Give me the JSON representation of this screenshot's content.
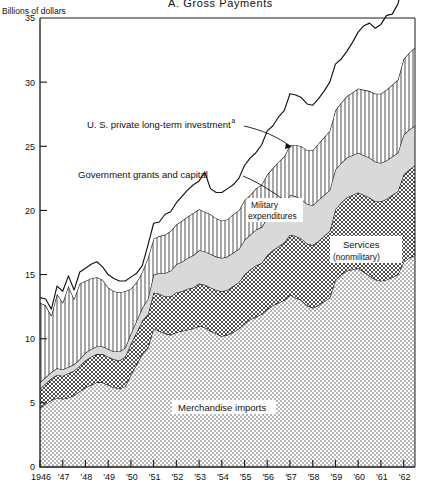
{
  "figure": {
    "panel_title": "A.   Gross  Payments",
    "y_unit_label": "Billions of dollars"
  },
  "chart_data": {
    "type": "area",
    "title": "A.   Gross  Payments",
    "subtitle": "",
    "xlabel": "",
    "ylabel": "Billions of dollars",
    "stacked": true,
    "grid": false,
    "legend_position": "inline-annotations",
    "xlim": [
      1946,
      1962.75
    ],
    "ylim": [
      0,
      35
    ],
    "yticks": [
      0,
      5,
      10,
      15,
      20,
      25,
      30,
      35
    ],
    "ytick_labels": [
      "0",
      "5",
      "10",
      "15",
      "20",
      "25",
      "30",
      "35"
    ],
    "xticks": [
      1946,
      1947,
      1948,
      1949,
      1950,
      1951,
      1952,
      1953,
      1954,
      1955,
      1956,
      1957,
      1958,
      1959,
      1960,
      1961,
      1962
    ],
    "xtick_labels": [
      "1946",
      "'47",
      "'48",
      "'49",
      "'50",
      "'51",
      "'52",
      "'53",
      "'54",
      "'55",
      "'56",
      "'57",
      "'58",
      "'59",
      "'60",
      "'61",
      "'62"
    ],
    "x": [
      1946.0,
      1946.25,
      1946.5,
      1946.75,
      1947.0,
      1947.25,
      1947.5,
      1947.75,
      1948.0,
      1948.25,
      1948.5,
      1948.75,
      1949.0,
      1949.25,
      1949.5,
      1949.75,
      1950.0,
      1950.25,
      1950.5,
      1950.75,
      1951.0,
      1951.25,
      1951.5,
      1951.75,
      1952.0,
      1952.25,
      1952.5,
      1952.75,
      1953.0,
      1953.25,
      1953.5,
      1953.75,
      1954.0,
      1954.25,
      1954.5,
      1954.75,
      1955.0,
      1955.25,
      1955.5,
      1955.75,
      1956.0,
      1956.25,
      1956.5,
      1956.75,
      1957.0,
      1957.25,
      1957.5,
      1957.75,
      1958.0,
      1958.25,
      1958.5,
      1958.75,
      1959.0,
      1959.25,
      1959.5,
      1959.75,
      1960.0,
      1960.25,
      1960.5,
      1960.75,
      1961.0,
      1961.25,
      1961.5,
      1961.75,
      1962.0,
      1962.25,
      1962.5
    ],
    "series": [
      {
        "name": "Merchandise imports",
        "label_text": "Merchandise imports",
        "fill_pattern": "fine-dot",
        "values": [
          4.6,
          4.9,
          5.2,
          5.4,
          5.3,
          5.4,
          5.6,
          5.9,
          6.2,
          6.4,
          6.6,
          6.6,
          6.4,
          6.2,
          6.1,
          6.3,
          7.2,
          8.0,
          8.8,
          9.3,
          10.8,
          10.6,
          10.4,
          10.3,
          10.5,
          10.6,
          10.7,
          10.8,
          11.0,
          10.9,
          10.6,
          10.4,
          10.2,
          10.3,
          10.5,
          10.8,
          11.2,
          11.5,
          11.7,
          11.9,
          12.3,
          12.6,
          12.8,
          13.0,
          13.4,
          13.2,
          13.0,
          12.6,
          12.4,
          12.6,
          12.9,
          13.2,
          14.6,
          15.0,
          15.3,
          15.4,
          15.5,
          15.2,
          14.9,
          14.6,
          14.5,
          14.6,
          14.8,
          15.0,
          16.0,
          16.3,
          16.5
        ]
      },
      {
        "name": "Services (nonmilitary)",
        "label_text": "Services\n(nonmilitary)",
        "fill_pattern": "cross-hatch",
        "values": [
          1.5,
          1.6,
          1.7,
          1.8,
          1.8,
          1.9,
          1.9,
          2.0,
          2.1,
          2.2,
          2.2,
          2.2,
          2.2,
          2.2,
          2.2,
          2.3,
          2.4,
          2.5,
          2.6,
          2.6,
          2.8,
          2.9,
          2.9,
          3.0,
          3.1,
          3.1,
          3.2,
          3.2,
          3.3,
          3.3,
          3.4,
          3.4,
          3.5,
          3.5,
          3.6,
          3.6,
          3.8,
          3.9,
          4.0,
          4.0,
          4.2,
          4.3,
          4.4,
          4.5,
          4.7,
          4.8,
          4.8,
          4.8,
          4.9,
          5.0,
          5.1,
          5.2,
          5.5,
          5.6,
          5.7,
          5.8,
          5.9,
          6.0,
          6.1,
          6.1,
          6.2,
          6.3,
          6.4,
          6.5,
          6.8,
          6.9,
          7.0
        ]
      },
      {
        "name": "Military expenditures",
        "label_text": "Military\nexpenditures",
        "fill_pattern": "light-gray",
        "values": [
          0.5,
          0.5,
          0.5,
          0.5,
          0.5,
          0.5,
          0.5,
          0.5,
          0.6,
          0.6,
          0.6,
          0.6,
          0.6,
          0.6,
          0.7,
          0.7,
          0.8,
          0.9,
          1.0,
          1.2,
          1.4,
          1.6,
          1.8,
          2.0,
          2.2,
          2.3,
          2.4,
          2.5,
          2.6,
          2.6,
          2.6,
          2.6,
          2.6,
          2.6,
          2.6,
          2.6,
          2.7,
          2.7,
          2.8,
          2.8,
          2.9,
          2.9,
          3.0,
          3.0,
          3.1,
          3.1,
          3.1,
          3.1,
          3.1,
          3.2,
          3.2,
          3.2,
          3.1,
          3.1,
          3.1,
          3.1,
          3.1,
          3.1,
          3.1,
          3.1,
          3.0,
          3.0,
          3.0,
          3.0,
          3.1,
          3.1,
          3.1
        ]
      },
      {
        "name": "Government grants and capital",
        "label_text": "Government grants and capital",
        "fill_pattern": "vertical-line",
        "values": [
          6.2,
          5.6,
          4.4,
          5.8,
          5.2,
          6.3,
          5.1,
          5.9,
          5.6,
          5.5,
          5.4,
          5.2,
          4.8,
          4.7,
          4.6,
          4.4,
          3.5,
          3.0,
          2.8,
          3.2,
          2.8,
          2.9,
          3.0,
          3.1,
          3.1,
          3.2,
          3.2,
          3.3,
          3.2,
          3.1,
          3.1,
          3.0,
          2.9,
          2.9,
          3.0,
          3.0,
          3.1,
          3.1,
          3.2,
          3.3,
          3.4,
          3.5,
          3.6,
          3.7,
          3.9,
          4.0,
          4.1,
          4.2,
          4.3,
          4.4,
          4.5,
          4.6,
          4.6,
          4.7,
          4.8,
          4.9,
          5.0,
          5.1,
          5.2,
          5.3,
          5.4,
          5.5,
          5.6,
          5.7,
          5.9,
          6.0,
          6.1
        ]
      },
      {
        "name": "U.S. private long-term investment",
        "label_text": "U. S. private long-term investment",
        "label_superscript": "a",
        "fill_pattern": "white",
        "values": [
          0.4,
          0.5,
          0.5,
          0.6,
          0.9,
          0.8,
          0.7,
          0.9,
          1.0,
          1.1,
          1.2,
          1.0,
          1.0,
          1.0,
          0.9,
          0.8,
          0.9,
          0.7,
          0.5,
          1.0,
          1.2,
          1.1,
          1.6,
          1.5,
          1.7,
          1.9,
          2.1,
          2.2,
          2.2,
          3.1,
          2.0,
          2.0,
          2.2,
          2.4,
          2.3,
          2.5,
          2.7,
          2.9,
          2.8,
          3.1,
          3.4,
          3.3,
          3.5,
          3.6,
          4.0,
          3.9,
          3.8,
          3.6,
          3.5,
          3.5,
          3.6,
          3.8,
          3.6,
          3.4,
          3.5,
          3.9,
          4.4,
          5.0,
          5.3,
          5.1,
          5.4,
          5.8,
          5.5,
          5.9,
          6.0,
          6.4,
          6.2
        ]
      }
    ],
    "annotations": [
      {
        "text": "U. S. private long-term investment",
        "superscript": "a"
      },
      {
        "text": "Government grants and capital"
      },
      {
        "text": "Military expenditures"
      },
      {
        "text": "Services (nonmilitary)"
      },
      {
        "text": "Merchandise imports"
      }
    ]
  },
  "labels": {
    "private_investment": "U. S. private long-term investment",
    "private_investment_sup": "a",
    "gov_grants": "Government grants and capital",
    "military_1": "Military",
    "military_2": "expenditures",
    "services_1": "Services",
    "services_2": "(nonmilitary)",
    "merchandise": "Merchandise imports"
  },
  "colors": {
    "axis": "#1a1a1a",
    "line": "#111111",
    "fill_light": "#f2f2f2",
    "fill_gray": "#d4d4d4",
    "background": "#ffffff"
  }
}
